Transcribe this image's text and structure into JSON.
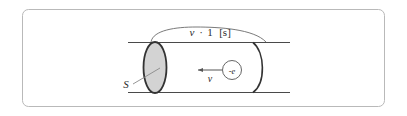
{
  "figure": {
    "type": "physics-diagram",
    "frame": {
      "name": "figure-border",
      "stroke_color": "#b9b9b9",
      "corner_radius": 6,
      "background_color": "#ffffff"
    },
    "colors": {
      "ink": "#2b2b2b",
      "line": "#4a4a4a",
      "thin_line": "#6b6b6b",
      "disk_fill": "#d3d3d3",
      "disk_stroke": "#333333",
      "leader": "#8a8a8a",
      "frame": "#b9b9b9"
    },
    "labels": {
      "length_label": "v · 1 [s]",
      "length_label_parts": {
        "speed_symbol": "v",
        "operator": "·",
        "time_value": "1",
        "time_unit": "[s]"
      },
      "area_label": "S",
      "velocity_label": "v",
      "charge_label": "-e"
    },
    "elements": {
      "conductor_top_line": "conductor-top-wall",
      "conductor_bottom_line": "conductor-bottom-wall",
      "cross_section_disk": "cross-section-area-S",
      "cylinder_back_arc": "cylinder-far-end-arc",
      "span_arc": "length-span-arc",
      "velocity_arrow": "drift-velocity-arrow",
      "electron": "electron-particle",
      "area_leader_line": "area-label-leader"
    }
  }
}
